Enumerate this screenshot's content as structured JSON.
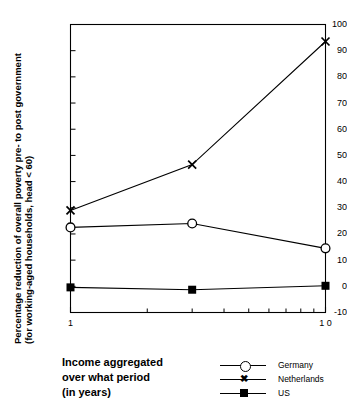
{
  "chart_data": {
    "type": "line",
    "title": "",
    "xlabel": "Income aggregated over what period (in years)",
    "ylabel": "Percentage reduction of overall poverty pre- to post government (for working-aged households, head < 60)",
    "ylabel_lines": [
      "Percentage reduction of overall poverty pre- to post government",
      "(for working-aged households, head <  60)"
    ],
    "xlabel_lines": [
      "Income aggregated",
      "over what period",
      "(in years)"
    ],
    "x_scale": "log",
    "xlim": [
      1,
      10
    ],
    "ylim": [
      -10,
      100
    ],
    "xticks": [
      1,
      10
    ],
    "xtick_labels": [
      "1",
      "1 0"
    ],
    "x_minor_ticks": [
      2,
      3,
      4,
      5,
      6,
      7,
      8,
      9
    ],
    "yticks": [
      -10,
      0,
      10,
      20,
      30,
      40,
      50,
      60,
      70,
      80,
      90,
      100
    ],
    "ytick_labels": [
      "-10",
      "0",
      "10",
      "20",
      "30",
      "40",
      "50",
      "60",
      "70",
      "80",
      "90",
      "100"
    ],
    "grid": false,
    "legend_position": "bottom-right",
    "x": [
      1,
      3,
      10
    ],
    "series": [
      {
        "name": "Germany",
        "marker": "open-circle",
        "values": [
          22.5,
          24.0,
          14.5
        ]
      },
      {
        "name": "Netherlands",
        "marker": "x",
        "values": [
          29.0,
          46.5,
          93.5
        ]
      },
      {
        "name": "US",
        "marker": "filled-square",
        "values": [
          -0.4,
          -1.3,
          0.2
        ]
      }
    ]
  },
  "legend": {
    "entries": [
      {
        "label": "Germany",
        "marker": "open-circle"
      },
      {
        "label": "Netherlands",
        "marker": "x"
      },
      {
        "label": "US",
        "marker": "filled-square"
      }
    ]
  },
  "axis": {
    "x_title_line1": "Income aggregated",
    "x_title_line2": "over what period",
    "x_title_line3": "(in years)",
    "y_title_line1": "Percentage reduction of overall poverty pre- to post government",
    "y_title_line2": "(for working-aged households, head <  60)"
  },
  "colors": {
    "ink": "#000000",
    "background": "#ffffff"
  }
}
